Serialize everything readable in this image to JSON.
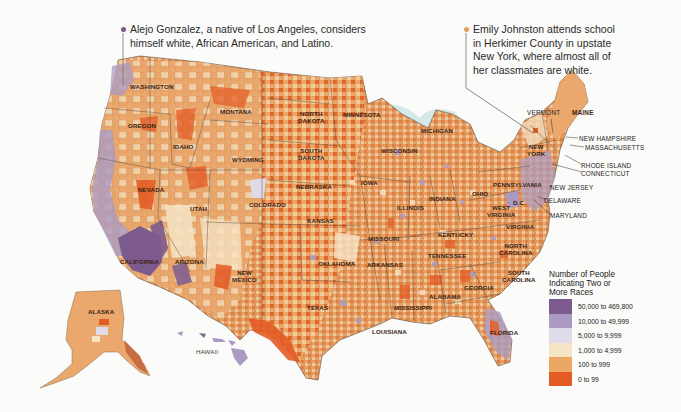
{
  "callouts": [
    {
      "id": "alejo",
      "text_line1": "Alejo Gonzalez, a native of Los Angeles, considers",
      "text_line2": "himself white, African American, and Latino.",
      "dot_color": "#7a5a86"
    },
    {
      "id": "emily",
      "text_line1": "Emily Johnston attends school",
      "text_line2": "in Herkimer County in upstate",
      "text_line3": "New York, where almost all of",
      "text_line4": "her classmates are white.",
      "dot_color": "#e0a25a"
    }
  ],
  "states": {
    "washington": "WASHINGTON",
    "oregon": "OREGON",
    "idaho": "IDAHO",
    "montana": "MONTANA",
    "north_dakota_1": "NORTH",
    "north_dakota_2": "DAKOTA",
    "minnesota": "MINNESOTA",
    "south_dakota_1": "SOUTH",
    "south_dakota_2": "DAKOTA",
    "wyoming": "WYOMING",
    "nevada": "NEVADA",
    "utah": "UTAH",
    "colorado": "COLORADO",
    "nebraska": "NEBRASKA",
    "iowa": "IOWA",
    "kansas": "KANSAS",
    "california": "CALIFORNIA",
    "arizona": "ARIZONA",
    "new_mexico_1": "NEW",
    "new_mexico_2": "MEXICO",
    "oklahoma": "OKLAHOMA",
    "texas": "TEXAS",
    "missouri": "MISSOURI",
    "arkansas": "ARKANSAS",
    "louisiana": "LOUISIANA",
    "mississippi": "MISSISSIPPI",
    "alabama": "ALABAMA",
    "georgia": "GEORGIA",
    "florida": "FLORIDA",
    "tennessee": "TENNESSEE",
    "kentucky": "KENTUCKY",
    "illinois": "ILLINOIS",
    "indiana": "INDIANA",
    "ohio": "OHIO",
    "wisconsin": "WISCONSIN",
    "michigan": "MICHIGAN",
    "pennsylvania": "PENNSYLVANIA",
    "west_virginia_1": "WEST",
    "west_virginia_2": "VIRGINIA",
    "virginia": "VIRGINIA",
    "north_carolina_1": "NORTH",
    "north_carolina_2": "CAROLINA",
    "south_carolina_1": "SOUTH",
    "south_carolina_2": "CAROLINA",
    "new_york_1": "NEW",
    "new_york_2": "YORK",
    "alaska": "ALASKA",
    "hawaii": "HAWAII",
    "dc": "D.C."
  },
  "external_labels": {
    "vermont": "VERMONT",
    "maine": "MAINE",
    "new_hampshire": "NEW HAMPSHIRE",
    "massachusetts": "MASSACHUSETTS",
    "rhode_island": "RHODE ISLAND",
    "connecticut": "CONNECTICUT",
    "new_jersey": "NEW JERSEY",
    "delaware": "DELAWARE",
    "maryland": "MARYLAND"
  },
  "legend": {
    "title_line1": "Number of People",
    "title_line2": "Indicating Two or",
    "title_line3": "More Races",
    "items": [
      {
        "label": "50,000 to 469,800",
        "color": "#7d5a8e"
      },
      {
        "label": "10,000 to 49,999",
        "color": "#ab9bc3"
      },
      {
        "label": "5,000 to 9,999",
        "color": "#e0dbe9"
      },
      {
        "label": "1,000 to 4,999",
        "color": "#f5e4c6"
      },
      {
        "label": "100 to 999",
        "color": "#eda764"
      },
      {
        "label": "0 to 99",
        "color": "#e35b25"
      }
    ]
  },
  "colors": {
    "water": "#d5e8ea",
    "background": "#fbfbfa",
    "border": "#5a4a3e"
  }
}
